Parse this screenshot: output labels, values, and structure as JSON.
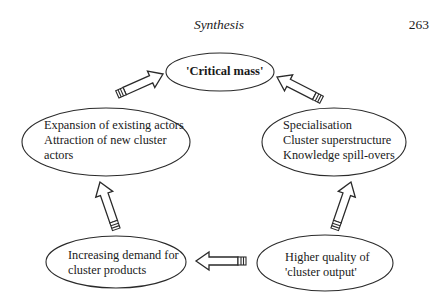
{
  "header": {
    "title": "Synthesis",
    "page_number": "263"
  },
  "diagram": {
    "type": "cycle",
    "nodes": [
      {
        "id": "critical_mass",
        "lines": [
          "'Critical mass'"
        ],
        "bold": true
      },
      {
        "id": "expansion",
        "lines": [
          "Expansion of existing actors",
          "Attraction of new cluster",
          "actors"
        ]
      },
      {
        "id": "specialisation",
        "lines": [
          "Specialisation",
          "Cluster superstructure",
          "Knowledge spill-overs"
        ]
      },
      {
        "id": "demand",
        "lines": [
          "Increasing demand for",
          "cluster products"
        ]
      },
      {
        "id": "quality",
        "lines": [
          "Higher quality of",
          "'cluster output'"
        ]
      }
    ],
    "edges": [
      {
        "from": "expansion",
        "to": "critical_mass"
      },
      {
        "from": "specialisation",
        "to": "critical_mass"
      },
      {
        "from": "demand",
        "to": "expansion"
      },
      {
        "from": "quality",
        "to": "specialisation"
      },
      {
        "from": "quality",
        "to": "demand"
      }
    ],
    "colors": {
      "stroke": "#2a2a2a",
      "fill": "#ffffff",
      "text": "#1a1a1a"
    }
  }
}
